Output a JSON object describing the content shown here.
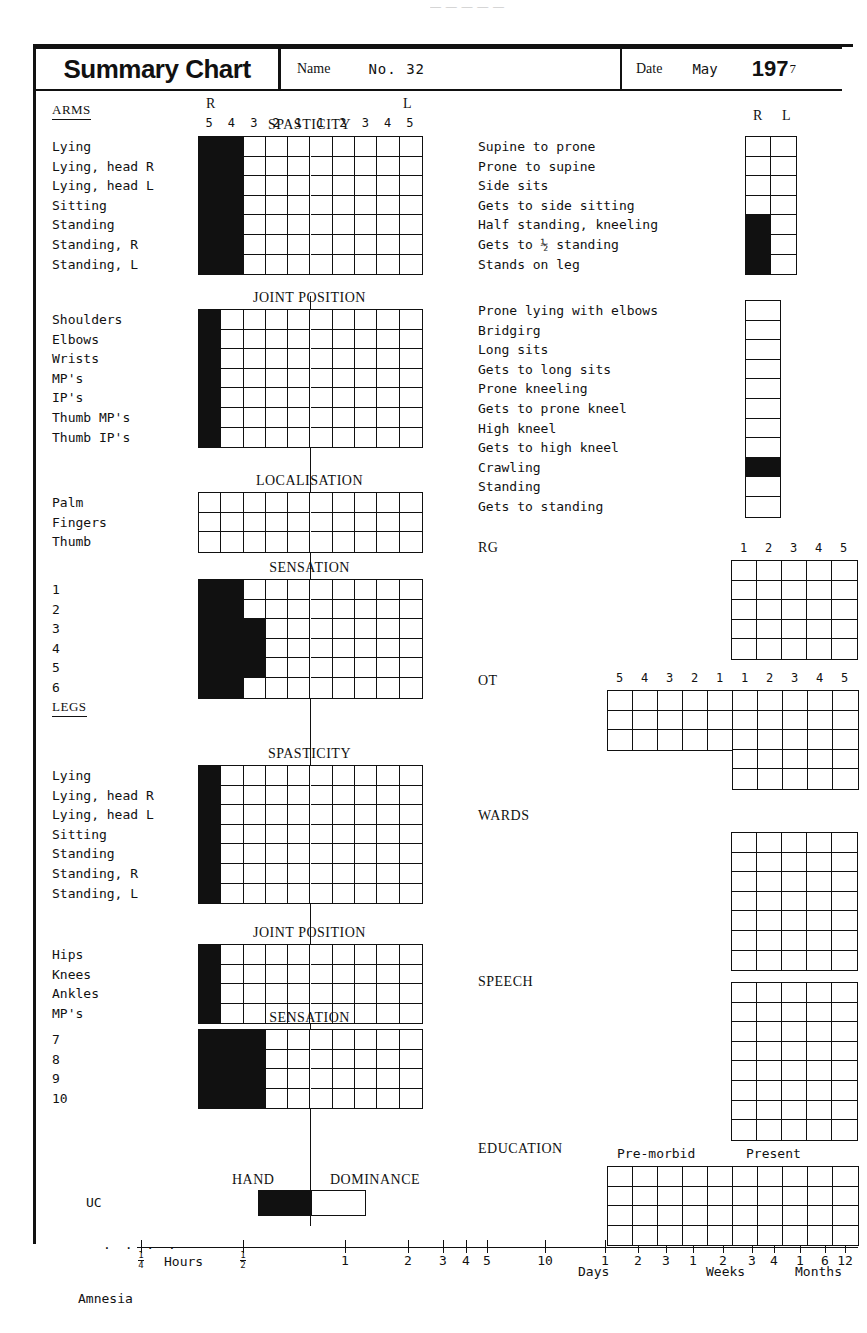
{
  "top_fragment": "— — — — —",
  "header": {
    "title": "Summary Chart",
    "name_label": "Name",
    "name_value": "No. 32",
    "date_label": "Date",
    "month": "May",
    "year_bold": "197",
    "year_tail": "7"
  },
  "scale_columns_10": [
    "5",
    "4",
    "3",
    "2",
    "1",
    "1",
    "2",
    "3",
    "4",
    "5"
  ],
  "scale_columns_5": [
    "1",
    "2",
    "3",
    "4",
    "5"
  ],
  "side_labels": {
    "right": "R",
    "left": "L"
  },
  "left_column": {
    "arms_group": "ARMS",
    "legs_group": "LEGS",
    "sections": [
      {
        "id": "arms-spasticity",
        "title": "SPASTICITY",
        "show_rl": true,
        "show_numbers": true,
        "cols": 10,
        "rows": [
          "Lying",
          "Lying, head R",
          "Lying, head L",
          "Sitting",
          "Standing",
          "Standing, R",
          "Standing, L"
        ],
        "filled": [
          2,
          2,
          2,
          2,
          2,
          2,
          2
        ]
      },
      {
        "id": "arms-joint-position",
        "title": "JOINT POSITION",
        "show_rl": false,
        "show_numbers": false,
        "cols": 10,
        "rows": [
          "Shoulders",
          "Elbows",
          "Wrists",
          "MP's",
          "IP's",
          "Thumb MP's",
          "Thumb IP's"
        ],
        "filled": [
          1,
          1,
          1,
          1,
          1,
          1,
          1
        ]
      },
      {
        "id": "arms-localisation",
        "title": "LOCALISATION",
        "show_rl": false,
        "show_numbers": false,
        "cols": 10,
        "rows": [
          "Palm",
          "Fingers",
          "Thumb"
        ],
        "filled": [
          0,
          0,
          0
        ]
      },
      {
        "id": "arms-sensation",
        "title": "SENSATION",
        "show_rl": false,
        "show_numbers": false,
        "cols": 10,
        "rows": [
          "1",
          "2",
          "3",
          "4",
          "5",
          "6"
        ],
        "filled": [
          2,
          2,
          3,
          3,
          3,
          2
        ]
      },
      {
        "id": "legs-spasticity",
        "title": "SPASTICITY",
        "show_rl": false,
        "show_numbers": false,
        "cols": 10,
        "rows": [
          "Lying",
          "Lying, head R",
          "Lying, head L",
          "Sitting",
          "Standing",
          "Standing, R",
          "Standing, L"
        ],
        "filled": [
          1,
          1,
          1,
          1,
          1,
          1,
          1
        ]
      },
      {
        "id": "legs-joint-position",
        "title": "JOINT POSITION",
        "show_rl": false,
        "show_numbers": false,
        "cols": 10,
        "rows": [
          "Hips",
          "Knees",
          "Ankles",
          "MP's"
        ],
        "filled": [
          1,
          1,
          1,
          1
        ]
      },
      {
        "id": "legs-sensation",
        "title": "SENSATION",
        "show_rl": false,
        "show_numbers": false,
        "cols": 10,
        "rows": [
          "7",
          "8",
          "9",
          "10"
        ],
        "filled": [
          3,
          3,
          3,
          3
        ]
      }
    ],
    "hand_dominance": {
      "left_word": "HAND",
      "right_word": "DOMINANCE",
      "marker_label": "UC"
    },
    "amnesia_label": "Amnesia"
  },
  "right_column": {
    "sections": [
      {
        "id": "mobility-rl",
        "show_rl": true,
        "cols": 2,
        "rows": [
          "Supine to prone",
          "Prone to supine",
          "Side sits",
          "Gets to side sitting",
          "Half standing, kneeling",
          "Gets to ½ standing",
          "Stands on leg"
        ],
        "filled_rows": [
          4,
          5,
          6
        ]
      },
      {
        "id": "mobility-single",
        "show_rl": false,
        "cols": 1,
        "rows": [
          "Prone lying with elbows",
          "Bridgirg",
          "Long sits",
          "Gets to long sits",
          "Prone kneeling",
          "Gets to prone kneel",
          "High kneel",
          "Gets to high kneel",
          "Crawling",
          "Standing",
          "Gets to standing"
        ],
        "filled_rows": [
          8
        ]
      }
    ],
    "panels": [
      {
        "id": "rg",
        "label": "RG",
        "header": "1-5",
        "cols": 5,
        "rows": 5
      },
      {
        "id": "ot",
        "label": "OT",
        "header": "10",
        "cols": 10,
        "rows": 3,
        "extra_rows": 2
      },
      {
        "id": "wards",
        "label": "WARDS",
        "header": "none",
        "cols": 5,
        "rows": 7
      },
      {
        "id": "speech",
        "label": "SPEECH",
        "header": "none",
        "cols": 5,
        "rows": 8
      },
      {
        "id": "education",
        "label": "EDUCATION",
        "header": "education",
        "cols": 10,
        "rows": 4
      }
    ],
    "education_headers": [
      "Pre-morbid",
      "Present"
    ]
  },
  "timeline": {
    "hours_word": "Hours",
    "ticks": [
      {
        "label": "¼",
        "frac": true,
        "num": "1",
        "den": "4"
      },
      {
        "label": "½",
        "frac": true,
        "num": "1",
        "den": "2"
      },
      {
        "label": "1"
      },
      {
        "label": "2"
      },
      {
        "label": "3"
      },
      {
        "label": "4"
      },
      {
        "label": "5"
      },
      {
        "label": "10"
      },
      {
        "label": "1"
      },
      {
        "label": "2"
      },
      {
        "label": "3"
      },
      {
        "label": "1"
      },
      {
        "label": "2"
      },
      {
        "label": "3"
      },
      {
        "label": "4"
      },
      {
        "label": "1"
      },
      {
        "label": "6"
      },
      {
        "label": "12"
      }
    ],
    "units": [
      "Days",
      "Weeks",
      "Months"
    ]
  }
}
